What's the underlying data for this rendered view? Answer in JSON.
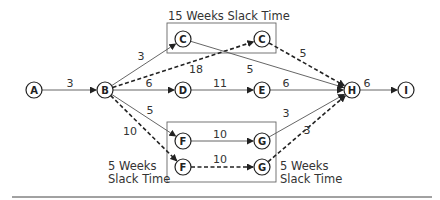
{
  "diagram": {
    "type": "network-pert",
    "nodes": [
      {
        "id": "A",
        "label": "A",
        "x": 34,
        "y": 90
      },
      {
        "id": "B",
        "label": "B",
        "x": 105,
        "y": 90
      },
      {
        "id": "C1",
        "label": "C",
        "x": 183,
        "y": 39
      },
      {
        "id": "C2",
        "label": "C",
        "x": 262,
        "y": 39
      },
      {
        "id": "D",
        "label": "D",
        "x": 183,
        "y": 90
      },
      {
        "id": "E",
        "label": "E",
        "x": 262,
        "y": 90
      },
      {
        "id": "H",
        "label": "H",
        "x": 352,
        "y": 90
      },
      {
        "id": "I",
        "label": "I",
        "x": 406,
        "y": 90
      },
      {
        "id": "F1",
        "label": "F",
        "x": 183,
        "y": 141
      },
      {
        "id": "G1",
        "label": "G",
        "x": 262,
        "y": 141
      },
      {
        "id": "F2",
        "label": "F",
        "x": 183,
        "y": 167
      },
      {
        "id": "G2",
        "label": "G",
        "x": 262,
        "y": 167
      }
    ],
    "edges": [
      {
        "from": "A",
        "to": "B",
        "label": "3",
        "style": "solid"
      },
      {
        "from": "B",
        "to": "C1",
        "label": "3",
        "style": "solid"
      },
      {
        "from": "B",
        "to": "C2",
        "label": "18",
        "style": "dashed"
      },
      {
        "from": "B",
        "to": "D",
        "label": "6",
        "style": "solid"
      },
      {
        "from": "B",
        "to": "F1",
        "label": "5",
        "style": "solid"
      },
      {
        "from": "B",
        "to": "F2",
        "label": "10",
        "style": "dashed"
      },
      {
        "from": "C1",
        "to": "H",
        "label": "5",
        "style": "solid"
      },
      {
        "from": "C2",
        "to": "H",
        "label": "5",
        "style": "dashed"
      },
      {
        "from": "D",
        "to": "E",
        "label": "11",
        "style": "solid"
      },
      {
        "from": "E",
        "to": "H",
        "label": "6",
        "style": "solid"
      },
      {
        "from": "F1",
        "to": "G1",
        "label": "10",
        "style": "solid"
      },
      {
        "from": "F2",
        "to": "G2",
        "label": "10",
        "style": "dashed"
      },
      {
        "from": "G1",
        "to": "H",
        "label": "3",
        "style": "solid"
      },
      {
        "from": "G2",
        "to": "H",
        "label": "3",
        "style": "dashed"
      },
      {
        "from": "H",
        "to": "I",
        "label": "6",
        "style": "solid"
      }
    ],
    "annotations": {
      "top": "15 Weeks Slack Time",
      "bottom_left_line1": "5 Weeks",
      "bottom_left_line2": "Slack Time",
      "bottom_right_line1": "5 Weeks",
      "bottom_right_line2": "Slack Time"
    },
    "colors": {
      "line": "#555555",
      "dashed": "#222222",
      "text": "#333333"
    }
  }
}
